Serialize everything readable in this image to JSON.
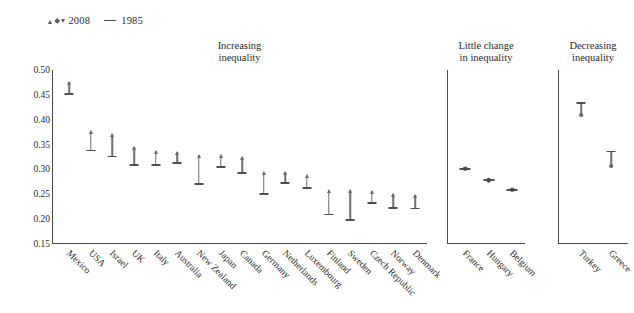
{
  "legend": {
    "markers_2008": [
      "triangle-up",
      "diamond",
      "triangle-down"
    ],
    "label_2008": "2008",
    "label_1985": "1985",
    "dash_1985": "line"
  },
  "axis": {
    "ticks": [
      "0.50",
      "0.45",
      "0.40",
      "0.35",
      "0.30",
      "0.25",
      "0.20",
      "0.15"
    ],
    "min": 0.15,
    "max": 0.5
  },
  "colors": {
    "line": "#4f4f4f",
    "stem": "#6f6f6f",
    "axis": "#4a4a4a",
    "text": "#2b2b2b"
  },
  "chart_data": {
    "type": "scatter",
    "title": "",
    "xlabel": "",
    "ylabel": "",
    "ylim": [
      0.15,
      0.5
    ],
    "ytick_values": [
      0.5,
      0.45,
      0.4,
      0.35,
      0.3,
      0.25,
      0.2,
      0.15
    ],
    "grid": false,
    "legend_position": "top-left",
    "series": [
      {
        "name": "1985",
        "marker": "dash"
      },
      {
        "name": "2008",
        "marker": "triangle/diamond"
      }
    ],
    "panels": [
      {
        "title": "Increasing\ninequality",
        "categories": [
          "Mexico",
          "USA",
          "Israel",
          "UK",
          "Italy",
          "Australia",
          "New Zealand",
          "Japan",
          "Canada",
          "Germany",
          "Netherlands",
          "Luxembourg",
          "Finland",
          "Sweden",
          "Czech Republic",
          "Norway",
          "Denmark"
        ],
        "values_1985": [
          0.452,
          0.338,
          0.326,
          0.309,
          0.309,
          0.312,
          0.271,
          0.304,
          0.293,
          0.251,
          0.272,
          0.262,
          0.209,
          0.198,
          0.232,
          0.222,
          0.221
        ],
        "values_2008": [
          0.476,
          0.378,
          0.371,
          0.345,
          0.337,
          0.336,
          0.33,
          0.329,
          0.324,
          0.295,
          0.294,
          0.288,
          0.259,
          0.259,
          0.256,
          0.25,
          0.248
        ]
      },
      {
        "title": "Little change\nin inequality",
        "categories": [
          "France",
          "Hungary",
          "Belgium"
        ],
        "values_1985": [
          0.3,
          0.277,
          0.259
        ],
        "values_2008": [
          0.303,
          0.279,
          0.259
        ]
      },
      {
        "title": "Decreasing\ninequality",
        "categories": [
          "Turkey",
          "Greece"
        ],
        "values_1985": [
          0.434,
          0.336
        ],
        "values_2008": [
          0.409,
          0.307
        ]
      }
    ]
  }
}
